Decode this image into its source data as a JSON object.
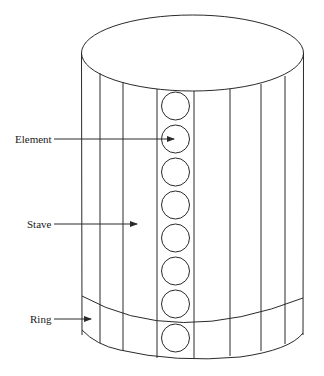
{
  "diagram": {
    "type": "cylindrical array schematic",
    "labels": [
      {
        "id": "element",
        "text": "Element",
        "x": 15,
        "y": 143,
        "arrow": {
          "x1": 54,
          "y1": 139,
          "x2": 175,
          "y2": 139
        }
      },
      {
        "id": "stave",
        "text": "Stave",
        "x": 27,
        "y": 228,
        "arrow": {
          "x1": 54,
          "y1": 224,
          "x2": 138,
          "y2": 224
        }
      },
      {
        "id": "ring",
        "text": "Ring",
        "x": 30,
        "y": 323,
        "arrow": {
          "x1": 54,
          "y1": 319,
          "x2": 92,
          "y2": 319
        }
      }
    ],
    "element_count": 8,
    "stave_count": 8,
    "colors": {
      "line": "#2a2a2a",
      "background": "#ffffff",
      "text": "#1a1a1a"
    }
  }
}
